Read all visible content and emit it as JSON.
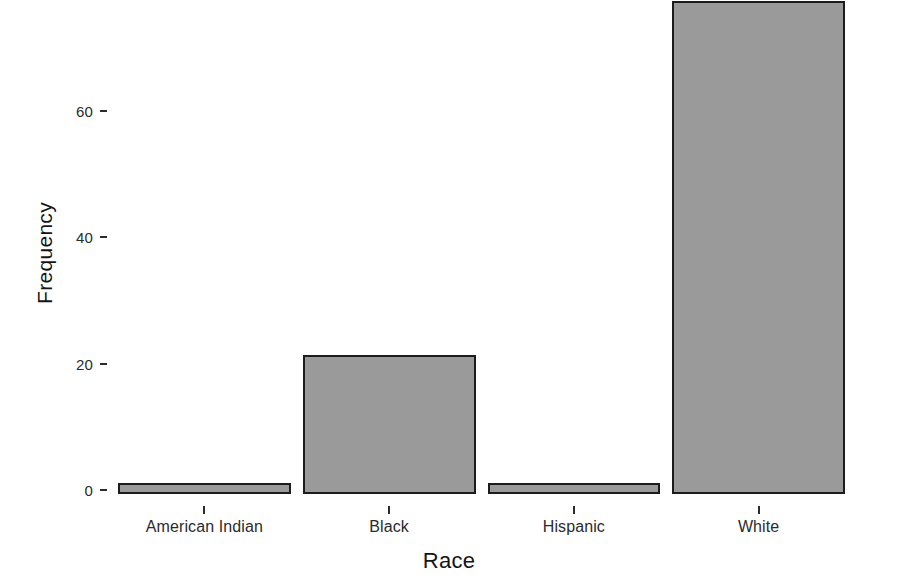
{
  "chart_data": {
    "type": "bar",
    "title": "",
    "subtitle": "",
    "xlabel": "Race",
    "ylabel": "Frequency",
    "categories": [
      "American Indian",
      "Black",
      "Hispanic",
      "White"
    ],
    "values": [
      1,
      22,
      1,
      78
    ],
    "series": [
      {
        "name": "Frequency",
        "values": [
          1,
          22,
          1,
          78
        ]
      }
    ],
    "yticks": [
      0,
      20,
      40,
      60
    ],
    "ytick_labels": [
      "0",
      "20",
      "40",
      "60"
    ],
    "ylim": [
      0,
      81
    ],
    "xlim_categories": 4,
    "grid": false,
    "legend": false,
    "legend_position": "none",
    "bar_fill_color": "#9a9a9a",
    "bar_border_color": "#1c1c1c",
    "background_color": "#ffffff",
    "text_color": "#2b2b2b",
    "annotations": []
  }
}
